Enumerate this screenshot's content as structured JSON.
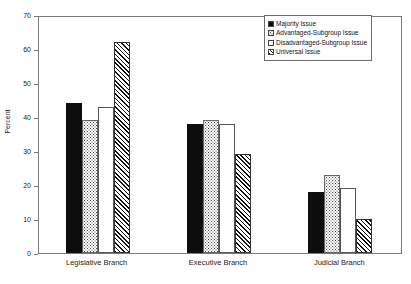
{
  "chart_data": {
    "type": "bar",
    "title": "",
    "subtitle": "",
    "xlabel": "",
    "ylabel": "Percent",
    "ylim": [
      0,
      70
    ],
    "ytick_step": 10,
    "yticks": [
      0,
      10,
      20,
      30,
      40,
      50,
      60,
      70
    ],
    "ytick_labels": [
      "0",
      "10",
      "20",
      "30",
      "40",
      "50",
      "60",
      "70"
    ],
    "grid": false,
    "legend_position": "top-right",
    "categories": [
      "Legislative Branch",
      "Executive Branch",
      "Judicial Branch"
    ],
    "series": [
      {
        "name": "Majority Issue",
        "pattern": "solid-black",
        "color": "#0d0d0d",
        "values": [
          44,
          38,
          18
        ]
      },
      {
        "name": "Advantaged-Subgroup Issue",
        "pattern": "dotted",
        "color": "#ffffff",
        "values": [
          39,
          39,
          23
        ]
      },
      {
        "name": "Disadvantaged-Subgroup Issue",
        "pattern": "empty",
        "color": "#ffffff",
        "values": [
          43,
          38,
          19
        ]
      },
      {
        "name": "Universal Issue",
        "pattern": "diagonal-hatch",
        "color": "#ffffff",
        "values": [
          62,
          29,
          10
        ]
      }
    ]
  },
  "legend": {
    "items": [
      {
        "label": "Majority Issue",
        "pattern": "solid-black"
      },
      {
        "label": "Advantaged-Subgroup Issue",
        "pattern": "dotted"
      },
      {
        "label": "Disadvantaged-Subgroup Issue",
        "pattern": "empty"
      },
      {
        "label": "Universal Issue",
        "pattern": "diagonal-hatch"
      }
    ]
  },
  "axes": {
    "y_title": "Percent"
  }
}
